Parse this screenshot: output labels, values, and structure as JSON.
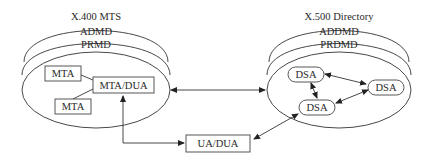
{
  "mts": {
    "title": "X.400 MTS",
    "layer1": "ADMD",
    "layer2": "PRMD",
    "node_mta1": "MTA",
    "node_mta2": "MTA",
    "node_mtadua": "MTA/DUA"
  },
  "directory": {
    "title": "X.500 Directory",
    "layer1": "ADDMD",
    "layer2": "PRDMD",
    "node_dsa1": "DSA",
    "node_dsa2": "DSA",
    "node_dsa3": "DSA"
  },
  "client": {
    "node_uadua": "UA/DUA"
  },
  "colors": {
    "stroke": "#333333",
    "text": "#2a2a2a",
    "background": "#ffffff"
  }
}
